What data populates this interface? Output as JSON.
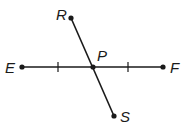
{
  "diagram": {
    "type": "geometry-segments",
    "points": [
      {
        "name": "E",
        "label": "E",
        "x": 22,
        "y": 67
      },
      {
        "name": "F",
        "label": "F",
        "x": 163,
        "y": 67
      },
      {
        "name": "P",
        "label": "P",
        "x": 93,
        "y": 67
      },
      {
        "name": "R",
        "label": "R",
        "x": 71,
        "y": 18
      },
      {
        "name": "S",
        "label": "S",
        "x": 114,
        "y": 116
      }
    ],
    "segments": [
      {
        "from": "E",
        "to": "F"
      },
      {
        "from": "R",
        "to": "S"
      }
    ],
    "congruence_ticks": [
      {
        "segment": "EP",
        "x": 58,
        "y": 67
      },
      {
        "segment": "PF",
        "x": 128,
        "y": 67
      }
    ],
    "colors": {
      "stroke": "#1a1a1a",
      "background": "#ffffff"
    }
  }
}
